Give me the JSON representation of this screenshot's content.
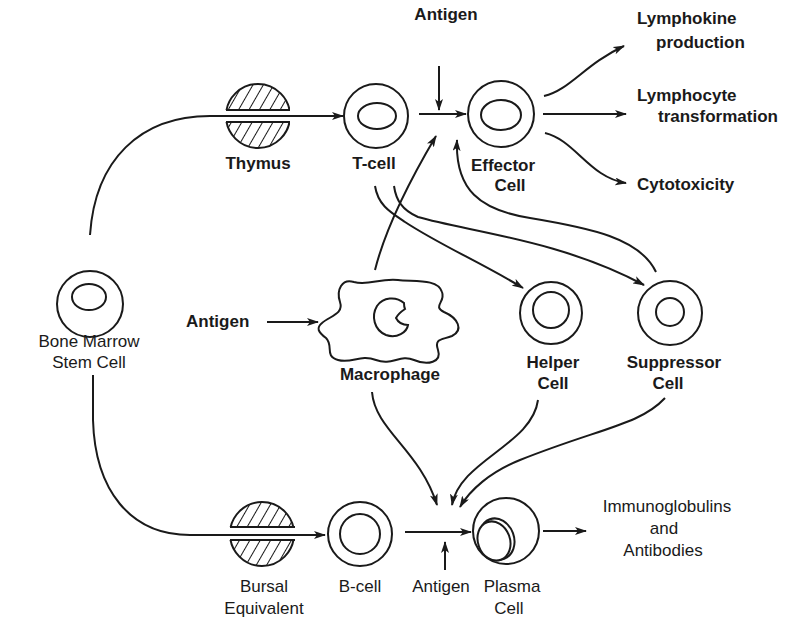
{
  "diagram": {
    "title": "",
    "nodes": {
      "stem_cell": {
        "label1": "Bone Marrow",
        "label2": "Stem Cell"
      },
      "thymus": {
        "label": "Thymus"
      },
      "t_cell": {
        "label": "T-cell"
      },
      "antigen_top": {
        "label": "Antigen"
      },
      "effector": {
        "label1": "Effector",
        "label2": "Cell"
      },
      "lymphokine": {
        "label1": "Lymphokine",
        "label2": "production"
      },
      "lymphocyte": {
        "label1": "Lymphocyte",
        "label2": "transformation"
      },
      "cytotoxicity": {
        "label": "Cytotoxicity"
      },
      "antigen_mid": {
        "label": "Antigen"
      },
      "macrophage": {
        "label": "Macrophage"
      },
      "helper": {
        "label1": "Helper",
        "label2": "Cell"
      },
      "suppressor": {
        "label1": "Suppressor",
        "label2": "Cell"
      },
      "bursal": {
        "label1": "Bursal",
        "label2": "Equivalent"
      },
      "b_cell": {
        "label": "B-cell"
      },
      "antigen_bottom": {
        "label": "Antigen"
      },
      "plasma": {
        "label1": "Plasma",
        "label2": "Cell"
      },
      "immunoglobulins": {
        "label1": "Immunoglobulins",
        "label2": "and",
        "label3": "Antibodies"
      }
    },
    "edges": [
      {
        "from": "Bone Marrow Stem Cell",
        "to": "T-cell",
        "via": "Thymus"
      },
      {
        "from": "Bone Marrow Stem Cell",
        "to": "B-cell",
        "via": "Bursal Equivalent"
      },
      {
        "from": "T-cell",
        "to": "Effector Cell"
      },
      {
        "from": "Antigen",
        "to": "Effector Cell"
      },
      {
        "from": "Effector Cell",
        "to": "Lymphokine production"
      },
      {
        "from": "Effector Cell",
        "to": "Lymphocyte transformation"
      },
      {
        "from": "Effector Cell",
        "to": "Cytotoxicity"
      },
      {
        "from": "T-cell",
        "to": "Helper Cell"
      },
      {
        "from": "T-cell",
        "to": "Suppressor Cell"
      },
      {
        "from": "Suppressor Cell",
        "to": "Effector Cell"
      },
      {
        "from": "Macrophage",
        "to": "Effector Cell"
      },
      {
        "from": "Antigen",
        "to": "Macrophage"
      },
      {
        "from": "Macrophage",
        "to": "Plasma Cell"
      },
      {
        "from": "Helper Cell",
        "to": "Plasma Cell"
      },
      {
        "from": "Suppressor Cell",
        "to": "Plasma Cell"
      },
      {
        "from": "B-cell",
        "to": "Plasma Cell"
      },
      {
        "from": "Antigen",
        "to": "Plasma Cell"
      },
      {
        "from": "Plasma Cell",
        "to": "Immunoglobulins and Antibodies"
      }
    ]
  }
}
